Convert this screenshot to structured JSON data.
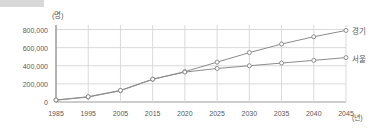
{
  "chart_data": {
    "type": "line",
    "title": "",
    "xlabel": "(년)",
    "ylabel": "(명)",
    "x": [
      1985,
      1995,
      2005,
      2015,
      2020,
      2025,
      2030,
      2035,
      2040,
      2045
    ],
    "xticklabels": [
      "1985",
      "1995",
      "2005",
      "2015",
      "2020",
      "2025",
      "2030",
      "2035",
      "2040",
      "2045"
    ],
    "yticklabels": [
      "0",
      "200,000",
      "400,000",
      "600,000",
      "800,000"
    ],
    "yticks": [
      0,
      200000,
      400000,
      800000
    ],
    "ylim": [
      0,
      850000
    ],
    "xlim": [
      1985,
      2045
    ],
    "grid": true,
    "legend_position": "right-inline",
    "series": [
      {
        "name": "경기",
        "color": "#8c8c8c",
        "marker": "open-circle",
        "values": [
          20000,
          55000,
          125000,
          250000,
          335000,
          440000,
          545000,
          640000,
          720000,
          790000
        ]
      },
      {
        "name": "서울",
        "color": "#8c8c8c",
        "marker": "open-circle",
        "values": [
          22000,
          58000,
          128000,
          252000,
          330000,
          370000,
          400000,
          430000,
          460000,
          490000
        ]
      }
    ]
  },
  "axis": {
    "y_unit": "(명)",
    "x_unit": "(년)"
  },
  "colors": {
    "line": "#8c8c8c",
    "grid": "#d9d9d9",
    "axis": "#9a9a9a",
    "text": "#5a5a5a",
    "marker_fill": "#ffffff",
    "topbar": "#d8d8d8"
  }
}
